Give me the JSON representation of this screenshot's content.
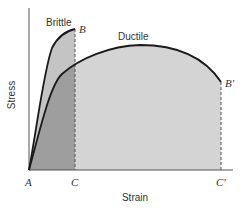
{
  "diagram": {
    "axes": {
      "y_label": "Stress",
      "x_label": "Strain"
    },
    "curves": [
      {
        "name": "Brittle",
        "end_point": "B",
        "end_strain_label": "C"
      },
      {
        "name": "Ductile",
        "end_point": "B'",
        "end_strain_label": "C'"
      }
    ],
    "points": {
      "origin": "A",
      "brittle_fracture": "B",
      "brittle_strain": "C",
      "ductile_fracture": "B'",
      "ductile_strain": "C'"
    },
    "colors": {
      "dark_fill": "#9e9e9e",
      "light_fill": "#d4d4d4",
      "brittle_fill": "#c6c6c6",
      "line": "#1a1a1a"
    }
  }
}
